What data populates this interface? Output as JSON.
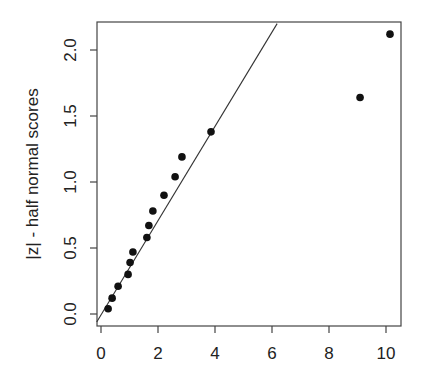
{
  "chart_data": {
    "type": "scatter",
    "title": "",
    "xlabel": "",
    "ylabel": "|z| - half normal scores",
    "xlim": [
      -0.15,
      10.5
    ],
    "ylim": [
      -0.06,
      2.2
    ],
    "xticks": [
      0,
      2,
      4,
      6,
      8,
      10
    ],
    "xtick_labels": [
      "0",
      "2",
      "4",
      "6",
      "8",
      "10"
    ],
    "yticks": [
      0.0,
      0.5,
      1.0,
      1.5,
      2.0
    ],
    "ytick_labels": [
      "0.0",
      "0.5",
      "1.0",
      "1.5",
      "2.0"
    ],
    "grid": false,
    "legend": null,
    "points": [
      {
        "x": 0.25,
        "y": 0.04
      },
      {
        "x": 0.39,
        "y": 0.12
      },
      {
        "x": 0.6,
        "y": 0.21
      },
      {
        "x": 0.95,
        "y": 0.3
      },
      {
        "x": 1.02,
        "y": 0.39
      },
      {
        "x": 1.12,
        "y": 0.47
      },
      {
        "x": 1.61,
        "y": 0.58
      },
      {
        "x": 1.68,
        "y": 0.67
      },
      {
        "x": 1.82,
        "y": 0.78
      },
      {
        "x": 2.21,
        "y": 0.9
      },
      {
        "x": 2.6,
        "y": 1.04
      },
      {
        "x": 2.84,
        "y": 1.19
      },
      {
        "x": 3.86,
        "y": 1.38
      },
      {
        "x": 9.09,
        "y": 1.64
      },
      {
        "x": 10.14,
        "y": 2.12
      }
    ],
    "reference_line": {
      "x0": -0.15,
      "y0": -0.06,
      "x1": 6.18,
      "y1": 2.2
    }
  }
}
